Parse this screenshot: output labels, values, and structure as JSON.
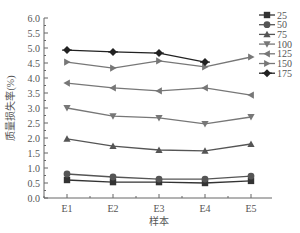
{
  "chart_data": {
    "type": "line",
    "title": "",
    "xlabel": "样本",
    "ylabel": "质量损失率(%)",
    "categories": [
      "E1",
      "E2",
      "E3",
      "E4",
      "E5"
    ],
    "ylim": [
      0.0,
      6.0
    ],
    "yticks": [
      "0.0",
      "0.5",
      "1.0",
      "1.5",
      "2.0",
      "2.5",
      "3.0",
      "3.5",
      "4.0",
      "4.5",
      "5.0",
      "5.5",
      "6.0"
    ],
    "grid": false,
    "legend_position": "upper right",
    "series": [
      {
        "name": "25",
        "marker": "square",
        "color": "#333333",
        "values": [
          0.6,
          0.53,
          0.53,
          0.5,
          0.57
        ]
      },
      {
        "name": "50",
        "marker": "circle",
        "color": "#555555",
        "values": [
          0.8,
          0.7,
          0.63,
          0.63,
          0.73
        ]
      },
      {
        "name": "75",
        "marker": "triangle-up",
        "color": "#555555",
        "values": [
          1.97,
          1.73,
          1.6,
          1.57,
          1.8
        ]
      },
      {
        "name": "100",
        "marker": "triangle-down",
        "color": "#777777",
        "values": [
          3.0,
          2.73,
          2.67,
          2.47,
          2.7
        ]
      },
      {
        "name": "125",
        "marker": "triangle-left",
        "color": "#777777",
        "values": [
          3.83,
          3.67,
          3.57,
          3.67,
          3.43
        ]
      },
      {
        "name": "150",
        "marker": "triangle-right",
        "color": "#777777",
        "values": [
          4.53,
          4.33,
          4.57,
          4.37,
          4.7
        ]
      },
      {
        "name": "175",
        "marker": "diamond",
        "color": "#222222",
        "values": [
          4.93,
          4.87,
          4.83,
          4.53,
          null
        ]
      }
    ]
  }
}
